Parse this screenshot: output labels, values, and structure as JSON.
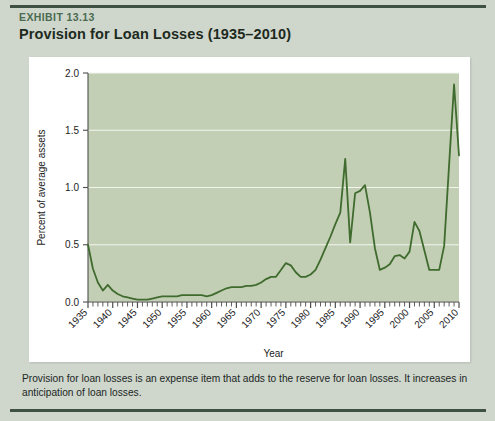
{
  "exhibit": {
    "label": "EXHIBIT 13.13",
    "title": "Provision for Loan Losses (1935–2010)"
  },
  "caption": {
    "text": "Provision for loan losses is an expense item that adds to the reserve for loan losses. It increases in anticipation of loan losses."
  },
  "colors": {
    "card_background": "#cfd6cc",
    "rule": "#3e5142",
    "exhibit_label": "#4a6b50",
    "title": "#1d2a20",
    "plot_background": "#c3cfb4",
    "gridline": "#f2f5ee",
    "line": "#3f6b2e",
    "panel": "#ffffff",
    "axis": "#4d4d4d"
  },
  "chart_data": {
    "type": "line",
    "title": "Provision for Loan Losses (1935–2010)",
    "xlabel": "Year",
    "ylabel": "Percent of average assets",
    "xlim": [
      1935,
      2010
    ],
    "ylim": [
      0.0,
      2.0
    ],
    "grid": true,
    "legend": null,
    "xticks": [
      1935,
      1940,
      1945,
      1950,
      1955,
      1960,
      1965,
      1970,
      1975,
      1980,
      1985,
      1990,
      1995,
      2000,
      2005,
      2010
    ],
    "xtick_labels": [
      "1935",
      "1940",
      "1945",
      "1950",
      "1955",
      "1960",
      "1965",
      "1970",
      "1975",
      "1980",
      "1985",
      "1990",
      "1995",
      "2000",
      "2005",
      "2010"
    ],
    "yticks": [
      0.0,
      0.5,
      1.0,
      1.5,
      2.0
    ],
    "ytick_labels": [
      "0.0",
      "0.5",
      "1.0",
      "1.5",
      "2.0"
    ],
    "minor_xtick_interval": 1,
    "series": [
      {
        "name": "Provision for loan losses",
        "x": [
          1935,
          1936,
          1937,
          1938,
          1939,
          1940,
          1941,
          1942,
          1943,
          1944,
          1945,
          1946,
          1947,
          1948,
          1949,
          1950,
          1951,
          1952,
          1953,
          1954,
          1955,
          1956,
          1957,
          1958,
          1959,
          1960,
          1961,
          1962,
          1963,
          1964,
          1965,
          1966,
          1967,
          1968,
          1969,
          1970,
          1971,
          1972,
          1973,
          1974,
          1975,
          1976,
          1977,
          1978,
          1979,
          1980,
          1981,
          1982,
          1983,
          1984,
          1985,
          1986,
          1987,
          1988,
          1989,
          1990,
          1991,
          1992,
          1993,
          1994,
          1995,
          1996,
          1997,
          1998,
          1999,
          2000,
          2001,
          2002,
          2003,
          2004,
          2005,
          2006,
          2007,
          2008,
          2009,
          2010
        ],
        "y": [
          0.5,
          0.29,
          0.17,
          0.1,
          0.15,
          0.1,
          0.07,
          0.05,
          0.04,
          0.03,
          0.02,
          0.02,
          0.02,
          0.03,
          0.04,
          0.05,
          0.05,
          0.05,
          0.05,
          0.06,
          0.06,
          0.06,
          0.06,
          0.06,
          0.05,
          0.06,
          0.08,
          0.1,
          0.12,
          0.13,
          0.13,
          0.13,
          0.14,
          0.14,
          0.15,
          0.17,
          0.2,
          0.22,
          0.22,
          0.28,
          0.34,
          0.32,
          0.26,
          0.22,
          0.22,
          0.24,
          0.28,
          0.37,
          0.47,
          0.57,
          0.68,
          0.78,
          1.25,
          0.52,
          0.95,
          0.97,
          1.02,
          0.78,
          0.47,
          0.28,
          0.3,
          0.33,
          0.4,
          0.41,
          0.38,
          0.44,
          0.7,
          0.62,
          0.45,
          0.28,
          0.28,
          0.28,
          0.49,
          1.2,
          1.9,
          1.28
        ]
      }
    ]
  },
  "axis": {
    "y_title": "Percent of average assets",
    "x_title": "Year"
  }
}
